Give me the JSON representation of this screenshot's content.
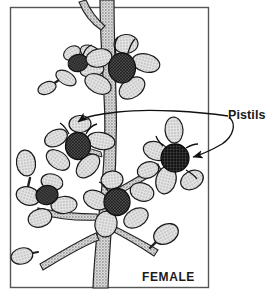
{
  "figure": {
    "title_text": "FEMALE",
    "callouts": [
      {
        "label": "Pistils",
        "target_count": 2
      }
    ],
    "frame": {
      "x": 10,
      "y": 7,
      "width": 199,
      "height": 281,
      "stroke": "#555555"
    },
    "colors": {
      "petal_fill": "#dcdcdc",
      "petal_stroke": "#1a1a1a",
      "pistil_dark": "#3a3a3a",
      "pistil_darkest": "#232323",
      "stem_fill": "#c6c6c6",
      "stem_stroke": "#222222",
      "bud_fill": "#d8d8d8",
      "leader_line": "#111111",
      "text": "#1a1a1a",
      "background": "#ffffff"
    },
    "elements": {
      "flowers": [
        {
          "name": "top-flower",
          "cx": 122,
          "cy": 68,
          "r": 26,
          "petals": 5
        },
        {
          "name": "upper-left-flower",
          "cx": 80,
          "cy": 62,
          "r": 18,
          "petals": 4
        },
        {
          "name": "mid-left-flower",
          "cx": 78,
          "cy": 145,
          "r": 24,
          "petals": 5
        },
        {
          "name": "right-flower",
          "cx": 177,
          "cy": 160,
          "r": 25,
          "petals": 5
        },
        {
          "name": "lower-center-flower",
          "cx": 116,
          "cy": 203,
          "r": 25,
          "petals": 5
        },
        {
          "name": "lower-left-flower",
          "cx": 45,
          "cy": 198,
          "r": 20,
          "petals": 4
        }
      ],
      "buds": [
        {
          "name": "bud-upper-left",
          "cx": 52,
          "cy": 85,
          "rx": 9,
          "ry": 6
        },
        {
          "name": "bud-left-upper",
          "cx": 25,
          "cy": 164,
          "rx": 9,
          "ry": 12
        },
        {
          "name": "bud-left-lower",
          "cx": 22,
          "cy": 253,
          "rx": 11,
          "ry": 8
        },
        {
          "name": "bud-lower-right",
          "cx": 163,
          "cy": 236,
          "rx": 12,
          "ry": 9
        }
      ],
      "stem": {
        "name": "main-stem",
        "top_x": 104,
        "bottom_x": 92,
        "width": 13
      }
    }
  }
}
